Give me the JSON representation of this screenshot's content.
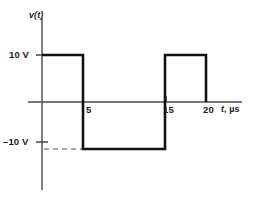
{
  "figure": {
    "name": "voltage-waveform-plot",
    "background_color": "#ffffff",
    "line_color": "#111111",
    "axis_color": "#4a4a4a"
  },
  "axes": {
    "y_axis_label": "v(t)",
    "x_axis_label_symbol": "t",
    "x_axis_label_unit": ", µs",
    "x_axis_label_full": "t, µs",
    "y_tick_labels": [
      "10 V",
      "–10 V"
    ],
    "x_tick_labels": [
      "5",
      "15",
      "20"
    ]
  },
  "chart_data": {
    "type": "line",
    "title": "",
    "subtitle": "",
    "xlabel": "t, µs",
    "ylabel": "v(t)",
    "xlim": [
      -2,
      24
    ],
    "ylim": [
      -14,
      14
    ],
    "xticks": [
      5,
      15,
      20
    ],
    "xticklabels": [
      "5",
      "15",
      "20"
    ],
    "yticks": [
      10,
      -10
    ],
    "yticklabels": [
      "10 V",
      "–10 V"
    ],
    "grid": false,
    "legend": null,
    "annotations": [
      {
        "name": "minus-ten-guide",
        "type": "dashed-horizontal-guide",
        "y": -10,
        "x_from": 0,
        "x_to": 5,
        "label": "–10 V"
      }
    ],
    "series": [
      {
        "name": "v(t)",
        "waveform": "square",
        "amplitude": 10,
        "unit": "V",
        "time_unit": "µs",
        "x": [
          0,
          5,
          5,
          15,
          15,
          20,
          20
        ],
        "y": [
          10,
          10,
          -10,
          -10,
          10,
          10,
          0
        ],
        "points": [
          {
            "t": 0,
            "v": 10
          },
          {
            "t": 5,
            "v": 10
          },
          {
            "t": 5,
            "v": -10
          },
          {
            "t": 15,
            "v": -10
          },
          {
            "t": 15,
            "v": 10
          },
          {
            "t": 20,
            "v": 10
          },
          {
            "t": 20,
            "v": 0
          }
        ]
      }
    ]
  }
}
